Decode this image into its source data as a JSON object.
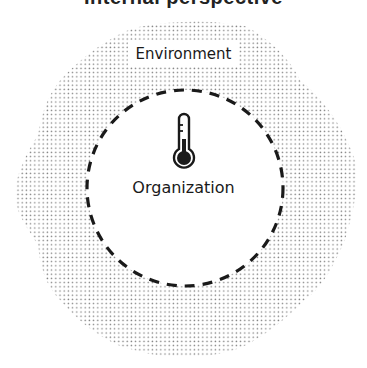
{
  "header": {
    "title": "Internal perspective"
  },
  "diagram": {
    "outer_region": {
      "label": "Environment",
      "fill": "dotted",
      "dot_color": "#8a8a8a"
    },
    "inner_region": {
      "label": "Organization",
      "border": "dashed",
      "border_color": "#1a1a1a"
    },
    "icon": "thermometer-icon"
  }
}
